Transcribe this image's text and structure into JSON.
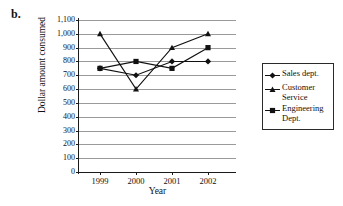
{
  "figure": {
    "label": "b."
  },
  "chart_data": {
    "type": "line",
    "title": "",
    "xlabel": "Year",
    "ylabel": "Dollar amount consumed",
    "categories": [
      "1999",
      "2000",
      "2001",
      "2002"
    ],
    "ylim": [
      0,
      1100
    ],
    "ytick_step": 100,
    "ytick_labels": [
      "0",
      "100",
      "200",
      "300",
      "400",
      "500",
      "600",
      "700",
      "800",
      "900",
      "1,000",
      "1,100"
    ],
    "ytick_values": [
      0,
      100,
      200,
      300,
      400,
      500,
      600,
      700,
      800,
      900,
      1000,
      1100
    ],
    "grid": true,
    "legend_position": "right",
    "series": [
      {
        "name": "Sales dept.",
        "marker": "diamond",
        "values": [
          750,
          700,
          800,
          800
        ]
      },
      {
        "name": "Customer Service",
        "marker": "triangle",
        "values": [
          1000,
          600,
          900,
          1000
        ]
      },
      {
        "name": "Engineering Dept.",
        "marker": "square",
        "values": [
          750,
          800,
          750,
          900
        ]
      }
    ]
  },
  "legend": {
    "items": [
      {
        "label": "Sales dept.",
        "marker": "diamond"
      },
      {
        "label": "Customer Service",
        "marker": "triangle"
      },
      {
        "label": "Engineering Dept.",
        "marker": "square"
      }
    ]
  },
  "colors": {
    "series": "#111111",
    "gridline": "#9a9a9a",
    "axis": "#1a1a1a",
    "background": "#ffffff"
  }
}
